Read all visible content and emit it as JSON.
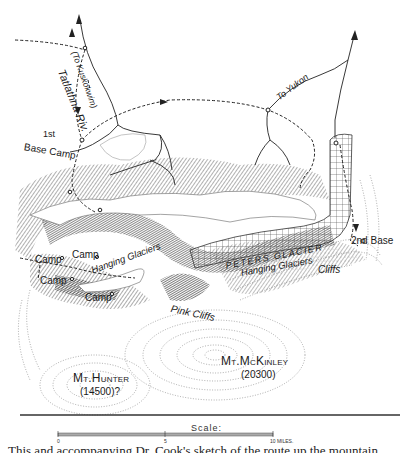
{
  "map": {
    "labels": {
      "river": "Tatlathna Riv.",
      "to_kuskokwim": "(To Kuskokwim)",
      "to_yukon": "To Yukon",
      "first_base_sup": "1st",
      "first_base": "Base Camp",
      "second_base": "2nd Base",
      "camp_1": "Camp",
      "camp_2": "Camp",
      "camp_3": "Camp",
      "camp_4": "Camp",
      "hanging_glaciers_west": "Hanging Glaciers",
      "peters_glacier": "PETERS GLACIER",
      "hanging_glaciers_east": "Hanging Glaciers",
      "cliffs": "Cliffs",
      "pink_cliffs": "Pink Cliffs",
      "mt_mckinley": "Mt.McKinley",
      "mt_mckinley_elev": "(20300)",
      "mt_hunter": "Mt.Hunter",
      "mt_hunter_elev": "(14500)?"
    },
    "scale": {
      "title": "Scale:",
      "ticks": [
        "0",
        "5",
        "10 MILES."
      ]
    },
    "caption": "This and accompanying Dr. Cook's sketch of the route up the mountain"
  }
}
